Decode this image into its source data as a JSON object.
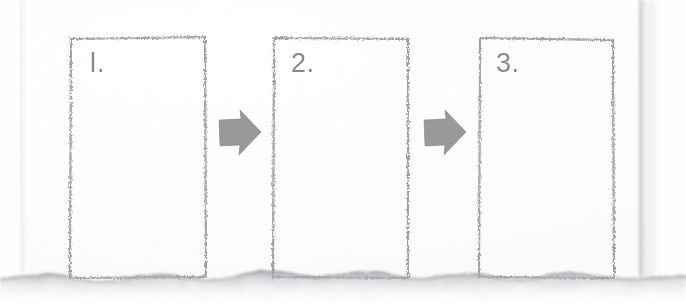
{
  "document": {
    "kind": "scanned-paper-storyboard",
    "title": "Three Step Storyboard",
    "background_color": "#ffffff",
    "paper_color": "#fdfdfd",
    "ink_color": "#6f6f70",
    "arrow_color": "#8a8a8c",
    "shadow_color": "#b9b9bd"
  },
  "steps": [
    {
      "id": "step-1",
      "number_label": "l.",
      "spoken_label": "1."
    },
    {
      "id": "step-2",
      "number_label": "2.",
      "spoken_label": "2."
    },
    {
      "id": "step-3",
      "number_label": "3.",
      "spoken_label": "3."
    }
  ],
  "arrows": [
    {
      "id": "arrow-1",
      "direction": "right",
      "from": "step-1",
      "to": "step-2"
    },
    {
      "id": "arrow-2",
      "direction": "right",
      "from": "step-2",
      "to": "step-3"
    }
  ],
  "edges": {
    "bottom": "torn-wavy-edge",
    "right": "paper-edge-with-shadow",
    "left": "faint-paper-edge"
  }
}
